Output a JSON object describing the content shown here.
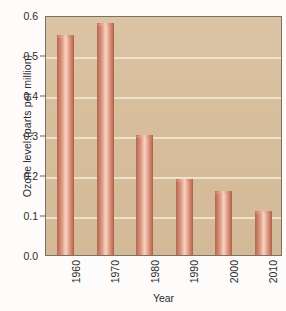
{
  "chart_data": {
    "type": "bar",
    "title": "",
    "xlabel": "Year",
    "ylabel": "Ozone level (parts per million)",
    "categories": [
      "1960",
      "1970",
      "1980",
      "1990",
      "2000",
      "2010"
    ],
    "values": [
      0.55,
      0.58,
      0.3,
      0.19,
      0.16,
      0.11
    ],
    "series": [
      {
        "name": "Ozone level",
        "values": [
          0.55,
          0.58,
          0.3,
          0.19,
          0.16,
          0.11
        ]
      }
    ],
    "ylim": [
      0.0,
      0.6
    ],
    "ytick_labels": [
      "0.0",
      "0.1",
      "0.2",
      "0.3",
      "0.4",
      "0.5",
      "0.6"
    ],
    "ytick_values": [
      0.0,
      0.1,
      0.2,
      0.3,
      0.4,
      0.5,
      0.6
    ],
    "grid": true,
    "gridlines_at": [
      0.1,
      0.2,
      0.3,
      0.4,
      0.5
    ],
    "legend": "none",
    "bar_color": "#d4876c",
    "plot_background_color": "#d7bd9b",
    "gridline_color": "#f2e6cf",
    "axis_color": "#7a7065",
    "text_color": "#2b2b2b"
  }
}
